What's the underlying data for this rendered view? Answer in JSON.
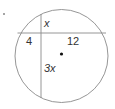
{
  "diagram": {
    "type": "intersecting-chords",
    "colors": {
      "stroke": "#8a8a8a",
      "text": "#333333",
      "dot": "#111111"
    },
    "circle": {
      "cx": 61.5,
      "cy": 56,
      "r": 46.5
    },
    "horizontal_chord": {
      "y": 33
    },
    "vertical_chord": {
      "x": 41
    },
    "labels": {
      "top_segment": "x",
      "left_segment": "4",
      "right_segment": "12",
      "bottom_segment": "3x"
    },
    "center_point": {
      "cx": 61.5,
      "cy": 54
    },
    "corner_mark": "·"
  }
}
